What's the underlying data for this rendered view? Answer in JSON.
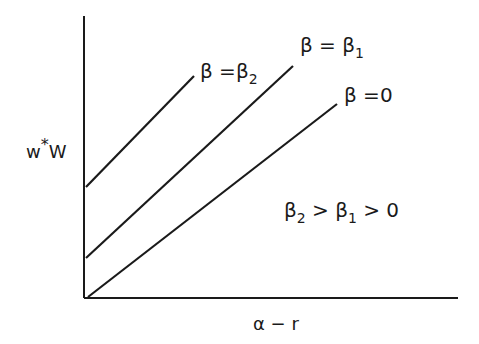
{
  "diagram": {
    "type": "line-diagram",
    "axes": {
      "ylabel": "w*W",
      "ylabel_base": "w",
      "ylabel_sup": "*",
      "ylabel_tail": "W",
      "xlabel": "α − r"
    },
    "lines": [
      {
        "label": "β = β₂",
        "beta_text": "β =β",
        "sub": "2",
        "intercept_px": 187
      },
      {
        "label": "β = β₁",
        "beta_text": "β = β",
        "sub": "1",
        "intercept_px": 258
      },
      {
        "label": "β = 0",
        "beta_text": "β =0",
        "sub": "",
        "intercept_px": 298
      }
    ],
    "annotation": {
      "text": "β₂ > β₁ > 0",
      "part1": "β",
      "sub1": "2",
      "part2": " > β",
      "sub2": "1",
      "part3": " > 0"
    },
    "colors": {
      "ink": "#1a1a1a",
      "background": "#ffffff"
    }
  }
}
